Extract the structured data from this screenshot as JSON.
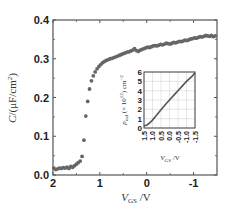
{
  "chart_data": [
    {
      "type": "scatter",
      "title": "",
      "xlabel": "V_GS /V",
      "ylabel": "C/(μF/cm²)",
      "xlim": [
        2,
        -1.5
      ],
      "ylim": [
        0.0,
        0.4
      ],
      "x_reversed": true,
      "grid": false,
      "x_ticks": [
        2,
        1,
        0,
        -1
      ],
      "x_tick_labels": [
        "2",
        "1",
        "0",
        "-1"
      ],
      "y_ticks": [
        0.0,
        0.1,
        0.2,
        0.3,
        0.4
      ],
      "y_tick_labels": [
        "0.0",
        "0.1",
        "0.2",
        "0.3",
        "0.4"
      ],
      "marker_color": "#666666",
      "series": [
        {
          "name": "C-V",
          "x": [
            1.98,
            1.94,
            1.9,
            1.86,
            1.82,
            1.78,
            1.74,
            1.7,
            1.66,
            1.62,
            1.58,
            1.54,
            1.5,
            1.46,
            1.42,
            1.38,
            1.34,
            1.3,
            1.26,
            1.22,
            1.18,
            1.14,
            1.1,
            1.06,
            1.02,
            0.98,
            0.94,
            0.9,
            0.86,
            0.82,
            0.78,
            0.74,
            0.7,
            0.66,
            0.62,
            0.58,
            0.54,
            0.5,
            0.46,
            0.42,
            0.38,
            0.34,
            0.3,
            0.26,
            0.22,
            0.18,
            0.14,
            0.1,
            0.06,
            0.02,
            -0.02,
            -0.06,
            -0.1,
            -0.14,
            -0.18,
            -0.22,
            -0.26,
            -0.3,
            -0.34,
            -0.38,
            -0.42,
            -0.46,
            -0.5,
            -0.54,
            -0.58,
            -0.62,
            -0.66,
            -0.7,
            -0.74,
            -0.78,
            -0.82,
            -0.86,
            -0.9,
            -0.94,
            -0.98,
            -1.02,
            -1.06,
            -1.1,
            -1.14,
            -1.18,
            -1.22,
            -1.26,
            -1.3,
            -1.34,
            -1.38,
            -1.42,
            -1.46
          ],
          "values": [
            0.018,
            0.014,
            0.016,
            0.018,
            0.017,
            0.019,
            0.018,
            0.02,
            0.017,
            0.022,
            0.02,
            0.024,
            0.028,
            0.032,
            0.036,
            0.048,
            0.09,
            0.152,
            0.19,
            0.222,
            0.243,
            0.256,
            0.266,
            0.274,
            0.28,
            0.285,
            0.29,
            0.293,
            0.296,
            0.298,
            0.3,
            0.301,
            0.303,
            0.305,
            0.307,
            0.309,
            0.311,
            0.313,
            0.315,
            0.317,
            0.318,
            0.32,
            0.322,
            0.326,
            0.321,
            0.319,
            0.322,
            0.324,
            0.326,
            0.328,
            0.33,
            0.329,
            0.331,
            0.333,
            0.334,
            0.333,
            0.335,
            0.337,
            0.336,
            0.338,
            0.34,
            0.339,
            0.338,
            0.34,
            0.342,
            0.341,
            0.343,
            0.345,
            0.344,
            0.346,
            0.348,
            0.347,
            0.349,
            0.351,
            0.352,
            0.354,
            0.353,
            0.355,
            0.357,
            0.356,
            0.358,
            0.36,
            0.359,
            0.358,
            0.36,
            0.357,
            0.359
          ]
        }
      ]
    },
    {
      "type": "line",
      "title": "",
      "xlabel": "V_GS /V",
      "ylabel": "p_ind (× 10¹²) cm⁻²",
      "xlim": [
        1.5,
        -1.5
      ],
      "ylim": [
        0,
        6
      ],
      "x_reversed": true,
      "grid": true,
      "x_ticks": [
        1.5,
        1.0,
        0.5,
        0.0,
        -0.5,
        -1.0,
        -1.5
      ],
      "x_tick_labels": [
        "1.5",
        "1.0",
        "0.5",
        "0.0",
        "-0.5",
        "-1.0",
        "-1.5"
      ],
      "y_ticks": [
        0,
        1,
        2,
        3,
        4,
        5,
        6
      ],
      "y_tick_labels": [
        "0",
        "1",
        "2",
        "3",
        "4",
        "5",
        "6"
      ],
      "line_color": "#555555",
      "series": [
        {
          "name": "p_ind",
          "x": [
            1.5,
            1.3,
            1.1,
            1.0,
            0.8,
            0.5,
            0.2,
            0.0,
            -0.3,
            -0.5,
            -0.8,
            -1.0,
            -1.3,
            -1.5
          ],
          "values": [
            0.2,
            0.35,
            0.65,
            0.85,
            1.3,
            1.95,
            2.6,
            3.0,
            3.6,
            4.0,
            4.6,
            5.0,
            5.5,
            5.9
          ]
        }
      ]
    }
  ],
  "labels": {
    "main_ylabel_C": "C",
    "main_ylabel_rest": "/(μF/cm",
    "main_ylabel_sup": "2",
    "main_ylabel_close": ")",
    "main_xlabel_V": "V",
    "main_xlabel_sub": "GS",
    "main_xlabel_unit": " /V",
    "inset_ylabel": "p",
    "inset_ylabel_sub": "ind",
    "inset_ylabel_rest": " (× 10",
    "inset_ylabel_sup": "12",
    "inset_ylabel_close": ") cm",
    "inset_ylabel_sup2": "−2",
    "inset_xlabel_V": "V",
    "inset_xlabel_sub": "GS",
    "inset_xlabel_unit": " /V"
  }
}
